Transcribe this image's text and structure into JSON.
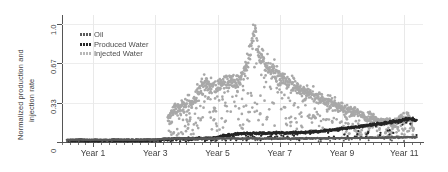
{
  "chart_data": {
    "type": "scatter",
    "title": "",
    "xlabel": "",
    "ylabel": "Normalized production and injection rate",
    "ylabel_line1": "Normalized production and",
    "ylabel_line2": "injection rate",
    "xlim": [
      0,
      11.6
    ],
    "ylim": [
      0,
      1.08
    ],
    "grid": true,
    "legend_position": "top-left",
    "yticks": [
      {
        "value": 0,
        "label": "0"
      },
      {
        "value": 0.33,
        "label": "0.33"
      },
      {
        "value": 0.67,
        "label": "0.67"
      },
      {
        "value": 1.0,
        "label": "1.0"
      }
    ],
    "xticks": [
      {
        "value": 1,
        "label": "Year 1"
      },
      {
        "value": 3,
        "label": "Year 3"
      },
      {
        "value": 5,
        "label": "Year 5"
      },
      {
        "value": 7,
        "label": "Year 7"
      },
      {
        "value": 9,
        "label": "Year 9"
      },
      {
        "value": 11,
        "label": "Year 11"
      }
    ],
    "series": [
      {
        "name": "Oil",
        "color": "#5a5a5a",
        "marker": "dot",
        "description": "Low flat oil rate near zero across all years",
        "points_x": [
          0.15,
          0.3,
          0.45,
          0.6,
          0.75,
          0.9,
          1.05,
          1.2,
          1.35,
          1.5,
          1.65,
          1.8,
          1.95,
          2.1,
          2.25,
          2.4,
          2.55,
          2.7,
          2.85,
          3.0,
          3.15,
          3.3,
          3.45,
          3.6,
          3.75,
          3.9,
          4.05,
          4.2,
          4.35,
          4.5,
          4.65,
          4.8,
          4.95,
          5.1,
          5.25,
          5.4,
          5.55,
          5.7,
          5.85,
          6.0,
          6.15,
          6.3,
          6.45,
          6.6,
          6.75,
          6.9,
          7.05,
          7.2,
          7.35,
          7.5,
          7.65,
          7.8,
          7.95,
          8.1,
          8.25,
          8.4,
          8.55,
          8.7,
          8.85,
          9.0,
          9.15,
          9.3,
          9.45,
          9.6,
          9.75,
          9.9,
          10.05,
          10.2,
          10.35,
          10.5,
          10.65,
          10.8,
          10.95,
          11.1,
          11.25,
          11.4
        ],
        "points_y": [
          0.018,
          0.02,
          0.019,
          0.022,
          0.02,
          0.018,
          0.021,
          0.019,
          0.02,
          0.018,
          0.022,
          0.02,
          0.019,
          0.021,
          0.018,
          0.02,
          0.019,
          0.022,
          0.02,
          0.021,
          0.024,
          0.026,
          0.03,
          0.028,
          0.032,
          0.03,
          0.029,
          0.031,
          0.028,
          0.03,
          0.027,
          0.029,
          0.031,
          0.033,
          0.03,
          0.032,
          0.031,
          0.029,
          0.03,
          0.032,
          0.031,
          0.03,
          0.029,
          0.031,
          0.03,
          0.029,
          0.028,
          0.03,
          0.029,
          0.031,
          0.03,
          0.029,
          0.03,
          0.031,
          0.032,
          0.03,
          0.031,
          0.033,
          0.032,
          0.034,
          0.033,
          0.035,
          0.034,
          0.036,
          0.035,
          0.037,
          0.036,
          0.038,
          0.037,
          0.039,
          0.038,
          0.04,
          0.039,
          0.041,
          0.04,
          0.042
        ]
      },
      {
        "name": "Produced Water",
        "color": "#262626",
        "marker": "dot",
        "description": "Near zero until year 5, then rises steadily to about 0.2 by year 11",
        "points_x": [
          0.2,
          0.6,
          1.0,
          1.4,
          1.8,
          2.2,
          2.6,
          3.0,
          3.4,
          3.8,
          4.2,
          4.5,
          4.8,
          5.0,
          5.2,
          5.4,
          5.6,
          5.8,
          6.0,
          6.2,
          6.4,
          6.6,
          6.8,
          7.0,
          7.2,
          7.4,
          7.6,
          7.8,
          8.0,
          8.2,
          8.4,
          8.6,
          8.8,
          9.0,
          9.2,
          9.4,
          9.6,
          9.8,
          10.0,
          10.2,
          10.4,
          10.6,
          10.8,
          11.0,
          11.2,
          11.4
        ],
        "points_y": [
          0.012,
          0.013,
          0.012,
          0.014,
          0.013,
          0.012,
          0.014,
          0.015,
          0.022,
          0.03,
          0.028,
          0.032,
          0.035,
          0.04,
          0.052,
          0.06,
          0.068,
          0.072,
          0.07,
          0.074,
          0.072,
          0.076,
          0.074,
          0.078,
          0.076,
          0.08,
          0.078,
          0.082,
          0.085,
          0.09,
          0.094,
          0.1,
          0.105,
          0.112,
          0.118,
          0.125,
          0.132,
          0.14,
          0.148,
          0.155,
          0.162,
          0.17,
          0.178,
          0.19,
          0.2,
          0.18
        ]
      },
      {
        "name": "Injected Water",
        "color": "#a8a8a8",
        "marker": "dot",
        "description": "Starts around year 3.4, rises to a plateau near 0.45-0.55, peaks near 0.95 at year 6.2, then declines to near 0.1 by year 11",
        "points_x": [
          3.4,
          3.6,
          3.8,
          4.0,
          4.2,
          4.4,
          4.6,
          4.8,
          5.0,
          5.2,
          5.4,
          5.6,
          5.8,
          6.0,
          6.1,
          6.2,
          6.3,
          6.5,
          6.7,
          6.9,
          7.1,
          7.3,
          7.5,
          7.7,
          7.9,
          8.1,
          8.3,
          8.5,
          8.7,
          8.9,
          9.1,
          9.3,
          9.5,
          9.7,
          9.9,
          10.1,
          10.3,
          10.5,
          10.7,
          10.9,
          11.1,
          11.3
        ],
        "points_y": [
          0.2,
          0.28,
          0.3,
          0.34,
          0.33,
          0.45,
          0.5,
          0.47,
          0.48,
          0.5,
          0.52,
          0.5,
          0.55,
          0.72,
          0.88,
          0.95,
          0.78,
          0.68,
          0.62,
          0.58,
          0.55,
          0.5,
          0.48,
          0.45,
          0.42,
          0.4,
          0.38,
          0.35,
          0.33,
          0.3,
          0.28,
          0.26,
          0.24,
          0.22,
          0.2,
          0.19,
          0.18,
          0.17,
          0.16,
          0.2,
          0.22,
          0.12
        ]
      }
    ]
  },
  "legend": {
    "items": [
      {
        "label": "Oil",
        "color": "#5a5a5a"
      },
      {
        "label": "Produced Water",
        "color": "#262626"
      },
      {
        "label": "Injected Water",
        "color": "#b0b0b0"
      }
    ]
  },
  "axis": {
    "y_title_line1": "Normalized production and",
    "y_title_line2": "injection rate",
    "y_tick_0": "0",
    "y_tick_1": "0.33",
    "y_tick_2": "0.67",
    "y_tick_3": "1.0",
    "x_tick_0": "Year 1",
    "x_tick_1": "Year 3",
    "x_tick_2": "Year 5",
    "x_tick_3": "Year 7",
    "x_tick_4": "Year 9",
    "x_tick_5": "Year 11"
  }
}
